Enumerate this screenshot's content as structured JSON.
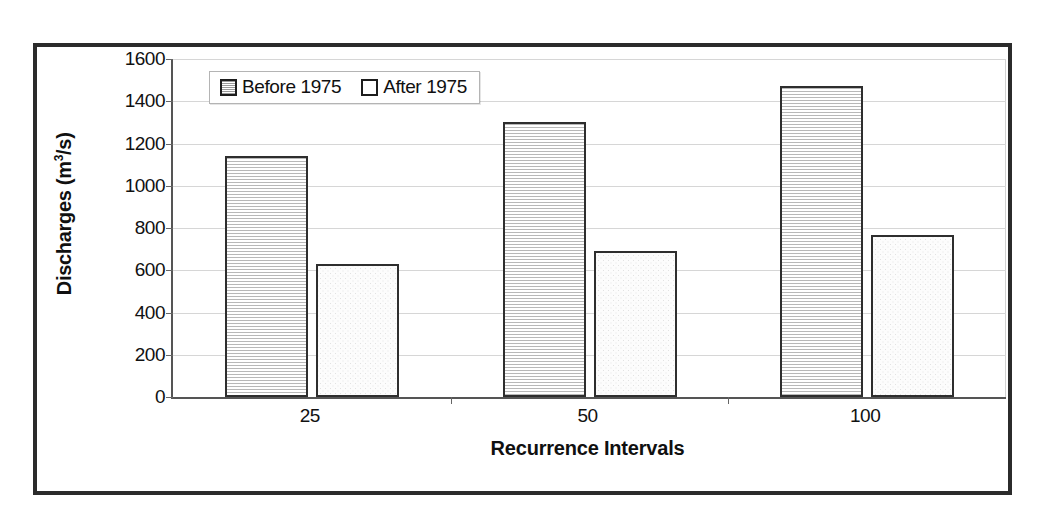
{
  "chart_data": {
    "type": "bar",
    "title": "",
    "xlabel": "Recurrence Intervals",
    "ylabel": "Discharges (m3/s)",
    "ylabel_prefix": "Discharges (m",
    "ylabel_sup": "3",
    "ylabel_suffix": "/s)",
    "categories": [
      "25",
      "50",
      "100"
    ],
    "series": [
      {
        "name": "Before 1975",
        "values": [
          1140,
          1300,
          1470
        ]
      },
      {
        "name": "After 1975",
        "values": [
          630,
          690,
          765
        ]
      }
    ],
    "ylim": [
      0,
      1600
    ],
    "yticks": [
      0,
      200,
      400,
      600,
      800,
      1000,
      1200,
      1400,
      1600
    ],
    "ytick_labels": [
      "0",
      "200",
      "400",
      "600",
      "800",
      "1000",
      "1200",
      "1400",
      "1600"
    ],
    "grid": true,
    "legend_position": "top-left-inside",
    "colors": {
      "bar_outline": "#2e2e2e",
      "before_fill": "#f2f2f2",
      "after_fill": "#fcfcfc",
      "gridline": "#d6d6d6",
      "axis": "#555555",
      "frame": "#2b2b2b",
      "text": "#101010"
    }
  },
  "legend": {
    "entries": [
      {
        "label": "Before 1975",
        "pattern": "horizontal-hatch"
      },
      {
        "label": "After 1975",
        "pattern": "stipple"
      }
    ]
  }
}
